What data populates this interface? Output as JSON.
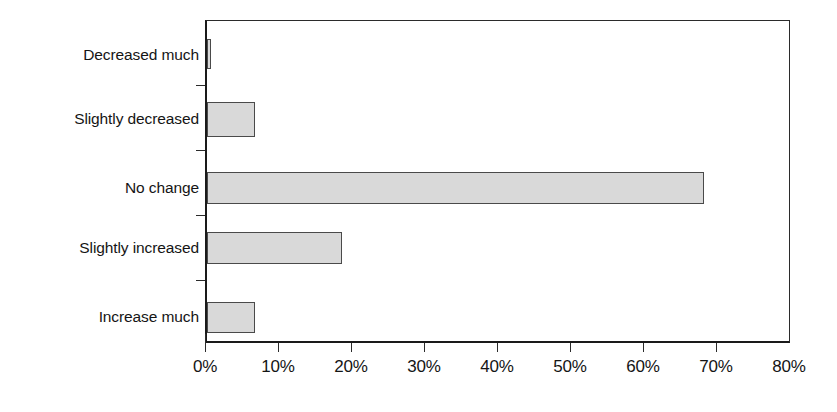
{
  "chart_data": {
    "type": "bar",
    "orientation": "horizontal",
    "title": "",
    "subtitle": "",
    "xlabel": "",
    "ylabel": "",
    "categories": [
      "Decreased much",
      "Slightly decreased",
      "No change",
      "Slightly increased",
      "Increase much"
    ],
    "values": [
      0.5,
      6.5,
      68.0,
      18.5,
      6.5
    ],
    "value_format": "percent",
    "xlim": [
      0,
      80
    ],
    "xticks": [
      0,
      10,
      20,
      30,
      40,
      50,
      60,
      70,
      80
    ],
    "xtick_labels": [
      "0%",
      "10%",
      "20%",
      "30%",
      "40%",
      "50%",
      "60%",
      "70%",
      "80%"
    ],
    "grid": false,
    "legend": null,
    "series": [
      {
        "name": "",
        "values": [
          0.5,
          6.5,
          68.0,
          18.5,
          6.5
        ]
      }
    ],
    "colors": {
      "bar_fill": "#d9d9d9",
      "bar_stroke": "#4a4a4a",
      "axis": "#1a1a1a",
      "text": "#151515",
      "background": "#ffffff"
    }
  },
  "axis": {
    "x_tick_labels": [
      "0%",
      "10%",
      "20%",
      "30%",
      "40%",
      "50%",
      "60%",
      "70%",
      "80%"
    ],
    "y_category_labels": [
      "Decreased much",
      "Slightly decreased",
      "No change",
      "Slightly increased",
      "Increase much"
    ]
  }
}
